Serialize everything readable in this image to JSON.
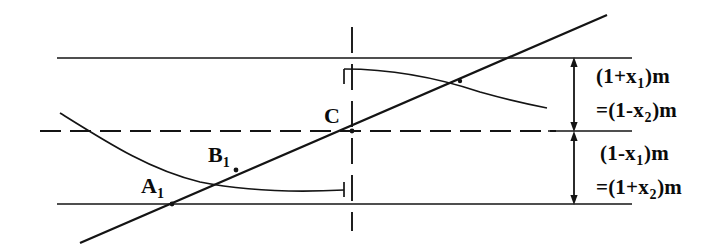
{
  "diagram": {
    "title": "",
    "colors": {
      "ink": "#141414",
      "background": "#ffffff"
    },
    "point_labels": [
      {
        "name": "A1",
        "text": "A",
        "subscript": "1",
        "x": 172,
        "y": 204
      },
      {
        "name": "B1",
        "text": "B",
        "subscript": "1",
        "x": 236,
        "y": 170
      },
      {
        "name": "C",
        "text": "C",
        "subscript": "",
        "x": 352,
        "y": 131
      }
    ],
    "dimension_labels": [
      {
        "name": "upper-dimension",
        "line1": {
          "pre": "(1+x",
          "sub": "1",
          "post": ")m"
        },
        "line2": {
          "pre": "=(1-x",
          "sub": "2",
          "post": ")m"
        },
        "span_from_y": 58,
        "span_to_y": 131
      },
      {
        "name": "lower-dimension",
        "line1": {
          "pre": "(1-x",
          "sub": "1",
          "post": ")m"
        },
        "line2": {
          "pre": "=(1+x",
          "sub": "2",
          "post": ")m"
        },
        "span_from_y": 131,
        "span_to_y": 204
      }
    ],
    "guides": {
      "top_line_y": 58,
      "center_line_y": 131,
      "bottom_line_y": 204,
      "vertical_line_x": 352,
      "dimension_arrow_x": 574,
      "horizontal_line_start_x": 57,
      "horizontal_line_end_x": 632
    },
    "curves": {
      "descending_branch": "M 60 113 C 108 143 150 170 200 182 C 250 192 305 192 344 190",
      "ascending_branch": "M 344 69 C 392 69 438 78 480 92 C 512 101 532 105 547 108",
      "straight_line": "M 80 243 L 607 15"
    }
  }
}
